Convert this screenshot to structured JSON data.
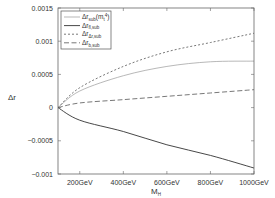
{
  "chart_data": {
    "type": "line",
    "title": "",
    "xlabel": "M_H",
    "ylabel": "Δr",
    "xlim": [
      100,
      1000
    ],
    "ylim": [
      -0.001,
      0.0015
    ],
    "grid": false,
    "legend_position": "upper left",
    "x": [
      100,
      200,
      400,
      600,
      800,
      1000
    ],
    "x_ticks": [
      {
        "value": 200,
        "label": "200GeV"
      },
      {
        "value": 400,
        "label": "400GeV"
      },
      {
        "value": 600,
        "label": "600GeV"
      },
      {
        "value": 800,
        "label": "800GeV"
      },
      {
        "value": 1000,
        "label": "1000GeV"
      }
    ],
    "y_ticks": [
      {
        "value": 0.0015,
        "label": "0.0015"
      },
      {
        "value": 0.001,
        "label": "0.001"
      },
      {
        "value": 0.0005,
        "label": "0.0005"
      },
      {
        "value": 0,
        "label": "0"
      },
      {
        "value": -0.0005,
        "label": "-0.0005"
      },
      {
        "value": -0.001,
        "label": "-0.001"
      }
    ],
    "series": [
      {
        "name": "Δr_sub(m_t^4)",
        "label_main": "Δr",
        "label_sub": "sub",
        "label_tail": "(m",
        "label_tail_sub": "t",
        "label_tail_sup": "4",
        "label_close": ")",
        "style": "thin-solid",
        "color": "#9a9a9a",
        "values": [
          0,
          0.00025,
          0.00048,
          0.00062,
          0.00069,
          0.0007
        ]
      },
      {
        "name": "Δr_fl,sub",
        "label_main": "Δr",
        "label_sub": "fl,sub",
        "style": "solid",
        "color": "#333333",
        "values": [
          0,
          -0.00019,
          -0.00036,
          -0.00056,
          -0.00072,
          -0.00091
        ]
      },
      {
        "name": "Δr_Δr,sub",
        "label_main": "Δr",
        "label_sub": "Δr,sub",
        "style": "short-dash",
        "color": "#555555",
        "values": [
          0,
          0.0003,
          0.00062,
          0.00084,
          0.00098,
          0.00112
        ]
      },
      {
        "name": "Δr_b,sub",
        "label_main": "Δr",
        "label_sub": "b,sub",
        "style": "long-dash",
        "color": "#555555",
        "values": [
          0,
          7e-05,
          0.00012,
          0.00017,
          0.00022,
          0.00027
        ]
      }
    ]
  },
  "axes": {
    "xlabel_main": "M",
    "xlabel_sub": "H",
    "ylabel": "Δr"
  }
}
